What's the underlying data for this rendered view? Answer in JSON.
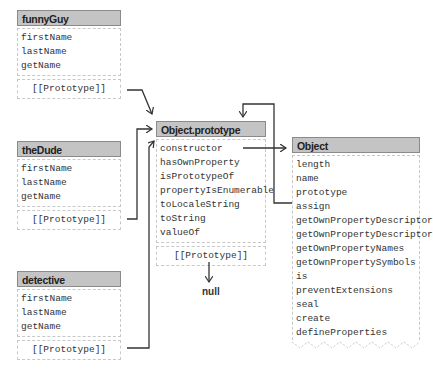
{
  "objects": {
    "funnyGuy": {
      "title": "funnyGuy",
      "fields": [
        "firstName",
        "lastName",
        "getName"
      ],
      "proto": "[[Prototype]]"
    },
    "theDude": {
      "title": "theDude",
      "fields": [
        "firstName",
        "lastName",
        "getName"
      ],
      "proto": "[[Prototype]]"
    },
    "detective": {
      "title": "detective",
      "fields": [
        "firstName",
        "lastName",
        "getName"
      ],
      "proto": "[[Prototype]]"
    },
    "objectPrototype": {
      "title": "Object.prototype",
      "fields": [
        "constructor",
        "hasOwnProperty",
        "isPrototypeOf",
        "propertyIsEnumerable",
        "toLocaleString",
        "toString",
        "valueOf"
      ],
      "proto": "[[Prototype]]"
    },
    "object": {
      "title": "Object",
      "fields": [
        "length",
        "name",
        "prototype",
        "assign",
        "getOwnPropertyDescriptor",
        "getOwnPropertyDescriptors",
        "getOwnPropertyNames",
        "getOwnPropertySymbols",
        "is",
        "preventExtensions",
        "seal",
        "create",
        "defineProperties"
      ]
    }
  },
  "null_label": "null",
  "colors": {
    "header_bg": "#c4c4c4",
    "header_border": "#8a8a8a",
    "dashed_border": "#c8c8c8",
    "arrow": "#333333"
  }
}
